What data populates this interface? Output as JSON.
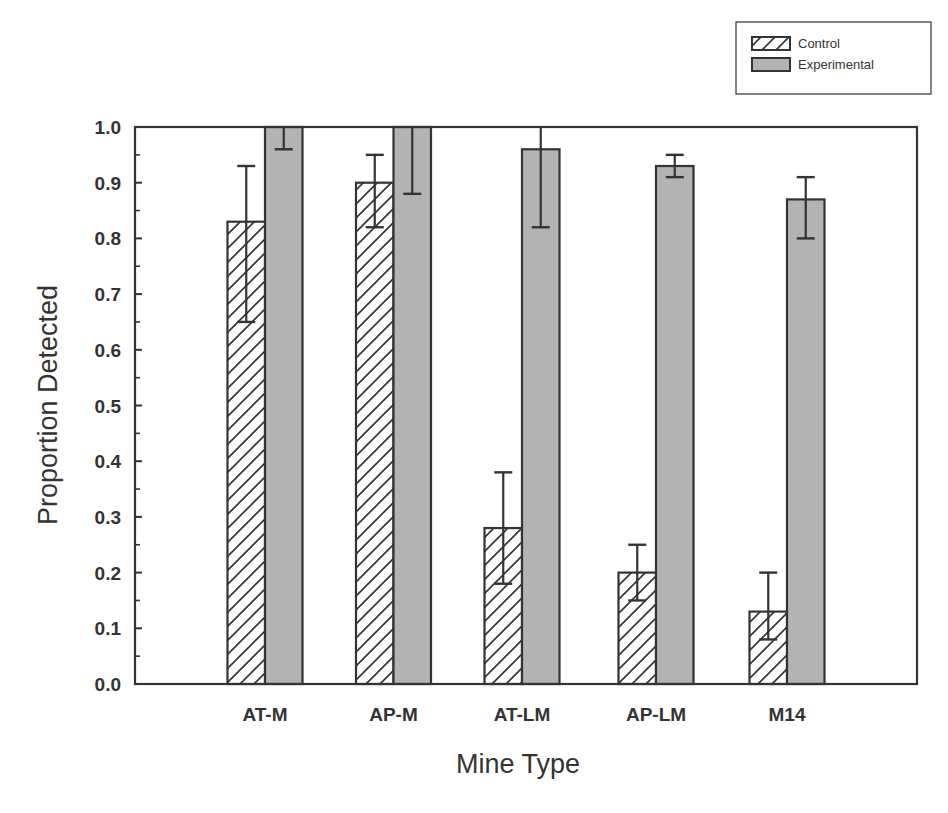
{
  "chart_data": {
    "type": "bar",
    "title": "",
    "xlabel": "Mine Type",
    "ylabel": "Proportion Detected",
    "ylim": [
      0.0,
      1.0
    ],
    "yticks": [
      "0.0",
      "0.1",
      "0.2",
      "0.3",
      "0.4",
      "0.5",
      "0.6",
      "0.7",
      "0.8",
      "0.9",
      "1.0"
    ],
    "grid": false,
    "legend_position": "top-right, outside plot",
    "categories": [
      "AT-M",
      "AP-M",
      "AT-LM",
      "AP-LM",
      "M14"
    ],
    "series": [
      {
        "name": "Control",
        "fill": "hatched",
        "values": [
          0.83,
          0.9,
          0.28,
          0.2,
          0.13
        ],
        "error_upper": [
          0.93,
          0.95,
          0.38,
          0.25,
          0.2
        ],
        "error_lower": [
          0.65,
          0.82,
          0.18,
          0.15,
          0.08
        ]
      },
      {
        "name": "Experimental",
        "fill": "#b3b3b3",
        "values": [
          1.0,
          1.0,
          0.96,
          0.93,
          0.87
        ],
        "error_upper": [
          1.0,
          1.0,
          1.0,
          0.95,
          0.91
        ],
        "error_lower": [
          0.96,
          0.88,
          0.82,
          0.91,
          0.8
        ]
      }
    ]
  },
  "legend": {
    "items": [
      {
        "label": "Control"
      },
      {
        "label": "Experimental"
      }
    ]
  },
  "axes": {
    "x_title": "Mine Type",
    "y_title": "Proportion Detected"
  },
  "colors": {
    "axis": "#333333",
    "experimental_fill": "#b3b3b3",
    "hatch": "#333333"
  }
}
